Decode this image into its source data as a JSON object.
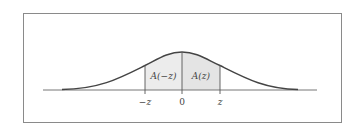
{
  "diagram": {
    "regions": [
      {
        "label": "A(−z)",
        "from": "−z",
        "to": "0"
      },
      {
        "label": "A(z)",
        "from": "0",
        "to": "z"
      }
    ],
    "axis_ticks": [
      {
        "label": "−z"
      },
      {
        "label": "0"
      },
      {
        "label": "z"
      }
    ],
    "colors": {
      "shade_left": "#ececec",
      "shade_right": "#e4e4e4",
      "curve": "#444444",
      "axis": "#777777",
      "frame": "#8a8a8a"
    }
  }
}
